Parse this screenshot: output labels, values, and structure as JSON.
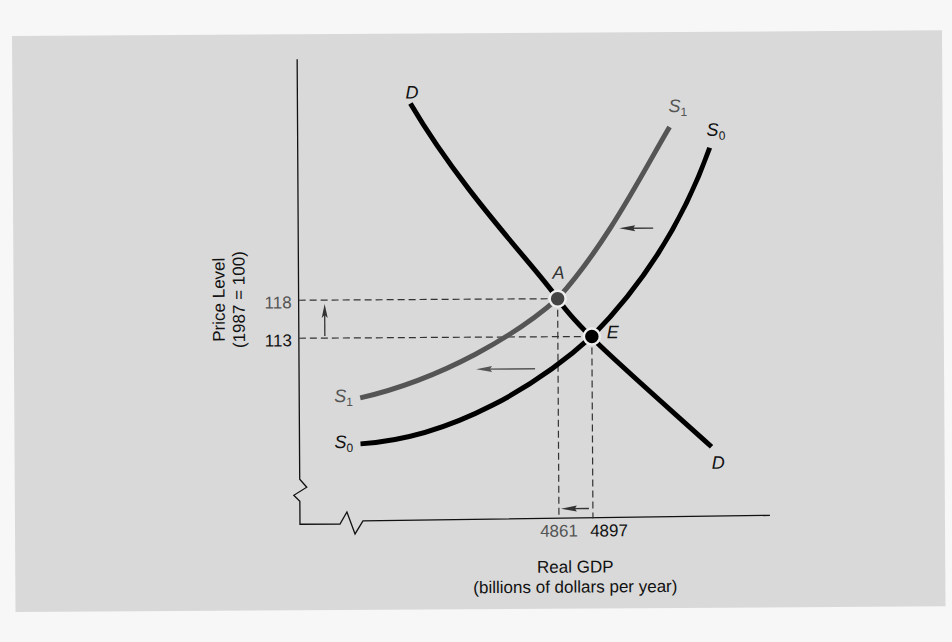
{
  "chart_data": {
    "type": "line",
    "title": "",
    "xlabel": "Real GDP",
    "xlabel_sub": "(billions of dollars per year)",
    "ylabel": "Price Level",
    "ylabel_sub": "(1987 = 100)",
    "x_ticks": [
      4861,
      4897
    ],
    "y_ticks": [
      113,
      118
    ],
    "axis_breaks": true,
    "grid": false,
    "legend": "none",
    "series": [
      {
        "name": "D",
        "label_start": "D",
        "label_end": "D",
        "kind": "aggregate demand",
        "color": "#000000",
        "passes_through": [
          [
            4861,
            118
          ],
          [
            4897,
            113
          ]
        ]
      },
      {
        "name": "S1",
        "label": "S",
        "label_sub": "1",
        "kind": "aggregate supply (shifted)",
        "color": "#555555",
        "passes_through": [
          [
            4861,
            118
          ]
        ]
      },
      {
        "name": "S0",
        "label": "S",
        "label_sub": "0",
        "kind": "aggregate supply (initial)",
        "color": "#000000",
        "passes_through": [
          [
            4897,
            113
          ]
        ]
      }
    ],
    "points": [
      {
        "name": "A",
        "x": 4861,
        "y": 118,
        "color": "#444444"
      },
      {
        "name": "E",
        "x": 4897,
        "y": 113,
        "color": "#000000"
      }
    ],
    "annotations": [
      {
        "type": "arrow",
        "direction": "left",
        "meaning": "supply curve shifts left"
      },
      {
        "type": "arrow",
        "direction": "left",
        "meaning": "supply curve shifts left"
      },
      {
        "type": "arrow",
        "direction": "up",
        "meaning": "price level rises from 113 to 118"
      },
      {
        "type": "arrow",
        "direction": "left",
        "meaning": "real GDP falls from 4897 to 4861"
      }
    ]
  },
  "colors": {
    "background": "#d9d9d9",
    "page": "#f7f7f7",
    "ink": "#000000",
    "shifted": "#555555"
  }
}
